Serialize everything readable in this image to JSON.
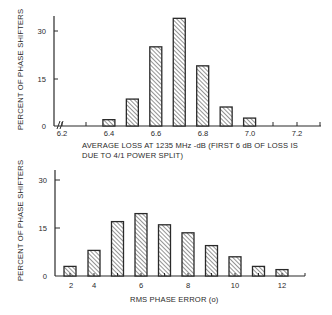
{
  "chart_data": [
    {
      "type": "bar",
      "title": "",
      "xlabel": "AVERAGE LOSS AT 1235 MHz -dB (FIRST 6 dB OF LOSS IS DUE TO 4/1 POWER SPLIT)",
      "xlabel_lines": [
        "AVERAGE LOSS AT 1235 MHz -dB (FIRST 6 dB OF LOSS IS",
        "DUE TO 4/1 POWER SPLIT)"
      ],
      "ylabel": "PERCENT OF PHASE SHIFTERS",
      "categories": [
        "6.4",
        "6.5",
        "6.6",
        "6.7",
        "6.8",
        "6.9",
        "7.0"
      ],
      "x": [
        6.4,
        6.5,
        6.6,
        6.7,
        6.8,
        6.9,
        7.0
      ],
      "values": [
        2,
        8.5,
        25,
        34,
        19,
        6,
        2.5
      ],
      "xtick_labels": [
        "6.2",
        "6.4",
        "6.6",
        "6.8",
        "7.0",
        "7.2"
      ],
      "ytick_labels": [
        "0",
        "15",
        "30"
      ],
      "xlim": [
        6.2,
        7.3
      ],
      "ylim": [
        0,
        36
      ],
      "axis_break": true,
      "grid": false,
      "legend": null,
      "bar_fill": "diagonal-hatch"
    },
    {
      "type": "bar",
      "title": "",
      "xlabel": "RMS PHASE ERROR (o)",
      "ylabel": "PERCENT OF PHASE SHIFTERS",
      "categories": [
        "2",
        "4",
        "5",
        "6",
        "7",
        "8",
        "9",
        "10",
        "11",
        "12"
      ],
      "x": [
        3,
        4,
        5,
        6,
        7,
        8,
        9,
        10,
        11,
        12
      ],
      "values": [
        3,
        8,
        17,
        19.5,
        16,
        13.5,
        9.5,
        6,
        3,
        2
      ],
      "xtick_labels": [
        "2",
        "4",
        "6",
        "8",
        "10",
        "12"
      ],
      "ytick_labels": [
        "0",
        "15",
        "30"
      ],
      "xlim": [
        2.5,
        13
      ],
      "ylim": [
        0,
        35
      ],
      "grid": false,
      "legend": null,
      "bar_fill": "diagonal-hatch"
    }
  ],
  "top": {
    "ylabel": "PERCENT OF PHASE SHIFTERS",
    "xlabel_line1": "AVERAGE LOSS AT 1235 MHz -dB (FIRST 6 dB OF LOSS IS",
    "xlabel_line2": "DUE TO 4/1 POWER SPLIT)",
    "yticks": [
      {
        "label": "0",
        "y": 126
      },
      {
        "label": "15",
        "y": 79
      },
      {
        "label": "30",
        "y": 31
      }
    ],
    "xticks": [
      {
        "label": "6.2",
        "x": 62
      },
      {
        "label": "",
        "x": 86
      },
      {
        "label": "6.4",
        "x": 109
      },
      {
        "label": "",
        "x": 133
      },
      {
        "label": "6.6",
        "x": 156
      },
      {
        "label": "",
        "x": 180
      },
      {
        "label": "6.8",
        "x": 203
      },
      {
        "label": "",
        "x": 227
      },
      {
        "label": "7.0",
        "x": 250
      },
      {
        "label": "",
        "x": 273
      },
      {
        "label": "7.2",
        "x": 297
      },
      {
        "label": "",
        "x": 320
      }
    ]
  },
  "bottom": {
    "ylabel": "PERCENT OF PHASE SHIFTERS",
    "xlabel": "RMS PHASE ERROR (o)",
    "yticks": [
      {
        "label": "0",
        "y": 276
      },
      {
        "label": "15",
        "y": 228
      },
      {
        "label": "30",
        "y": 180
      }
    ],
    "xticks": [
      {
        "label": "2",
        "x": 71
      },
      {
        "label": "4",
        "x": 94
      },
      {
        "label": "6",
        "x": 141
      },
      {
        "label": "8",
        "x": 188
      },
      {
        "label": "10",
        "x": 235
      },
      {
        "label": "12",
        "x": 282
      }
    ]
  },
  "colors": {
    "ink": "#2a2a2a",
    "background": "#ffffff"
  }
}
